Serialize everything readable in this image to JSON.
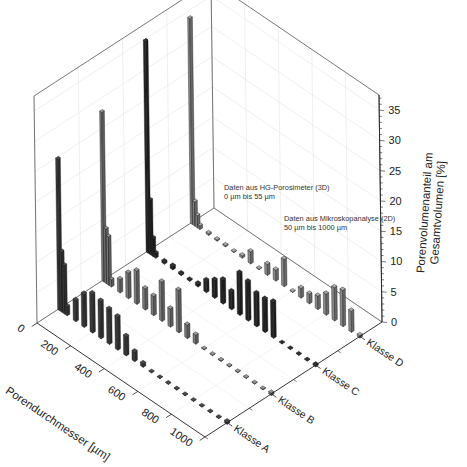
{
  "chart_data": {
    "type": "bar3d",
    "title": "",
    "xlabel": "Porendurchmesser [µm]",
    "ylabel": "",
    "zlabel_line1": "Porenvolumenanteil am",
    "zlabel_line2": "Gesamtvolumen [%]",
    "x_ticks": [
      "0",
      "200",
      "400",
      "600",
      "800",
      "1000"
    ],
    "z_ticks": [
      "0",
      "5",
      "10",
      "15",
      "20",
      "25",
      "30",
      "35"
    ],
    "xlim": [
      0,
      1000
    ],
    "zlim": [
      0,
      37.5
    ],
    "categories": [
      "Klasse A",
      "Klasse B",
      "Klasse C",
      "Klasse D"
    ],
    "grid": true,
    "annotations": [
      {
        "line1": "Daten aus HG-Porosimeter (3D)",
        "line2": "0 µm bis 55 µm"
      },
      {
        "line1": "Daten aus Mikroskopanalyse (2D)",
        "line2": "50 µm bis 1000 µm"
      }
    ],
    "series": [
      {
        "name": "Klasse A",
        "color": "#3a3a3a",
        "x": [
          5,
          20,
          35,
          50,
          100,
          150,
          200,
          250,
          300,
          350,
          400,
          450,
          500,
          550,
          600,
          650,
          700,
          750,
          800,
          850,
          900,
          950,
          1000
        ],
        "values": [
          25,
          10,
          8,
          1.5,
          3.5,
          5.5,
          6.5,
          6.2,
          5.8,
          5.5,
          3.2,
          1.6,
          0.6,
          0.1,
          0.1,
          0.1,
          0.1,
          0.1,
          0.1,
          0.1,
          0.1,
          0.1,
          0.4
        ]
      },
      {
        "name": "Klasse B",
        "color": "#7a7a7a",
        "x": [
          5,
          20,
          35,
          50,
          100,
          150,
          200,
          250,
          300,
          350,
          400,
          450,
          500,
          550,
          600,
          650,
          700,
          750,
          800,
          850,
          900,
          950,
          1000
        ],
        "values": [
          28,
          9,
          8,
          1.2,
          2.2,
          4.2,
          5.5,
          3.5,
          3.2,
          6.5,
          3.0,
          7.0,
          2.2,
          1.5,
          0.1,
          0.1,
          0.1,
          0.1,
          0.1,
          0.1,
          0.1,
          0.1,
          0.4
        ]
      },
      {
        "name": "Klasse C",
        "color": "#262626",
        "x": [
          5,
          20,
          35,
          50,
          100,
          150,
          200,
          250,
          300,
          350,
          400,
          450,
          500,
          550,
          600,
          650,
          700,
          750,
          800,
          850,
          900,
          950,
          1000
        ],
        "values": [
          35,
          9,
          3,
          0.8,
          0.4,
          0.6,
          0.3,
          0.2,
          0.5,
          2.0,
          3.0,
          4.0,
          3.0,
          7.0,
          6.5,
          5.5,
          5.5,
          6.0,
          0.1,
          0.1,
          0.1,
          0.1,
          0.3
        ]
      },
      {
        "name": "Klasse D",
        "color": "#8a8a8a",
        "x": [
          5,
          20,
          35,
          50,
          100,
          150,
          200,
          250,
          300,
          350,
          400,
          450,
          500,
          550,
          600,
          650,
          700,
          750,
          800,
          850,
          900,
          950,
          1000
        ],
        "values": [
          34,
          4,
          2,
          0.6,
          0.3,
          0.2,
          0.2,
          0.1,
          0.4,
          2.0,
          0.1,
          1.8,
          1.8,
          4.5,
          0.1,
          1.6,
          1.6,
          2.2,
          3.5,
          5.5,
          6.0,
          3.5,
          0.4
        ]
      }
    ]
  }
}
